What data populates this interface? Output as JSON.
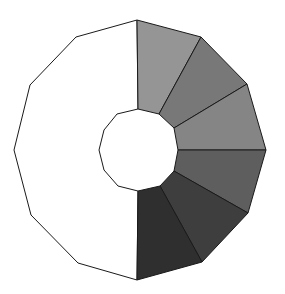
{
  "diagram": {
    "type": "polygonal-ring",
    "background": "#ffffff",
    "stroke": "#1a1a1a",
    "left_half": {
      "fill": "#ffffff",
      "outer_points": [
        [
          137,
          20
        ],
        [
          76,
          37
        ],
        [
          30,
          85
        ],
        [
          14,
          150
        ],
        [
          31,
          215
        ],
        [
          78,
          263
        ],
        [
          137,
          280
        ]
      ],
      "inner_points": [
        [
          138,
          191
        ],
        [
          118,
          186
        ],
        [
          104,
          170
        ],
        [
          99,
          150
        ],
        [
          104,
          130
        ],
        [
          117,
          114
        ],
        [
          138,
          109
        ]
      ]
    },
    "segments": [
      {
        "label": "segment-1",
        "fill": "#959595",
        "points": [
          [
            137,
            20
          ],
          [
            201,
            37
          ],
          [
            159,
            114
          ],
          [
            138,
            109
          ]
        ]
      },
      {
        "label": "segment-2",
        "fill": "#787878",
        "points": [
          [
            201,
            37
          ],
          [
            247,
            84
          ],
          [
            174,
            128
          ],
          [
            159,
            114
          ]
        ]
      },
      {
        "label": "segment-3",
        "fill": "#858585",
        "points": [
          [
            247,
            84
          ],
          [
            266,
            150
          ],
          [
            178,
            150
          ],
          [
            174,
            128
          ]
        ]
      },
      {
        "label": "segment-4",
        "fill": "#5e5e5e",
        "points": [
          [
            266,
            150
          ],
          [
            248,
            213
          ],
          [
            174,
            171
          ],
          [
            178,
            150
          ]
        ]
      },
      {
        "label": "segment-5",
        "fill": "#3e3e3e",
        "points": [
          [
            248,
            213
          ],
          [
            202,
            262
          ],
          [
            160,
            186
          ],
          [
            174,
            171
          ]
        ]
      },
      {
        "label": "segment-6",
        "fill": "#2f2f2f",
        "points": [
          [
            202,
            262
          ],
          [
            137,
            280
          ],
          [
            138,
            191
          ],
          [
            160,
            186
          ]
        ]
      }
    ]
  }
}
